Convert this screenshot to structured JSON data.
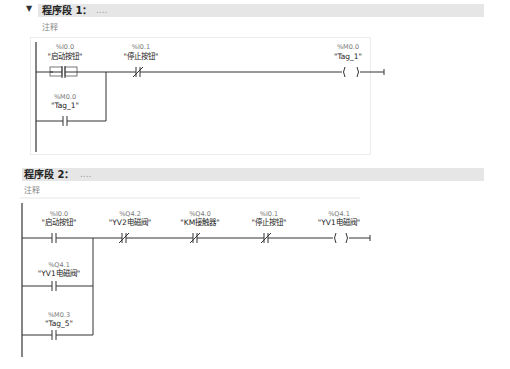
{
  "networks": [
    {
      "chevron": "▼",
      "title": "程序段 1：",
      "title_suffix": "....",
      "comment": "注释",
      "contacts": [
        {
          "address": "%I0.0",
          "symbol": "\"启动按钮\"",
          "type": "no-selected"
        },
        {
          "address": "%I0.1",
          "symbol": "\"停止按钮\"",
          "type": "nc"
        },
        {
          "address": "%M0.0",
          "symbol": "\"Tag_1\"",
          "type": "no"
        }
      ],
      "coil": {
        "address": "%M0.0",
        "symbol": "\"Tag_1\""
      }
    },
    {
      "title": "程序段 2：",
      "title_suffix": "....",
      "comment": "注释",
      "contacts": [
        {
          "address": "%I0.0",
          "symbol": "\"启动按钮\"",
          "type": "no"
        },
        {
          "address": "%Q4.2",
          "symbol": "\"YV2电磁阀\"",
          "type": "nc"
        },
        {
          "address": "%Q4.0",
          "symbol": "\"KM接触器\"",
          "type": "nc"
        },
        {
          "address": "%I0.1",
          "symbol": "\"停止按钮\"",
          "type": "nc"
        },
        {
          "address": "%Q4.1",
          "symbol": "\"YV1电磁阀\"",
          "type": "no"
        },
        {
          "address": "%M0.3",
          "symbol": "\"Tag_5\"",
          "type": "no"
        }
      ],
      "coil": {
        "address": "%Q4.1",
        "symbol": "\"YV1电磁阀\""
      }
    }
  ]
}
